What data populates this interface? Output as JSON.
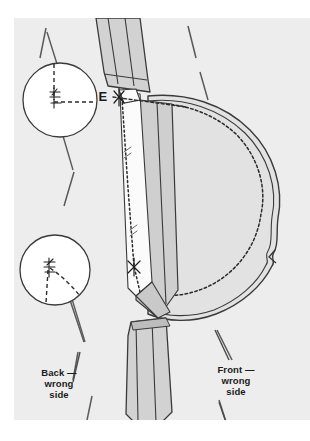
{
  "figure": {
    "type": "sewing-construction-diagram",
    "canvas": {
      "width": 310,
      "height": 441
    },
    "background_color": "#ffffff",
    "panel": {
      "color": "#ededed",
      "x": 14,
      "y": 18,
      "width": 296,
      "height": 402
    },
    "colors": {
      "panel_gray": "#ededed",
      "fabric_light": "#e2e2e2",
      "fabric_mid": "#d2d2d2",
      "fabric_dark": "#bdbdbd",
      "fabric_white": "#fbfbfb",
      "outline": "#3a3a3a",
      "stitch": "#2b2b2b",
      "text": "#1b1b1b",
      "circle_fill": "#ffffff"
    }
  },
  "labels": {
    "point_e": "E",
    "back_piece": "Back —\nwrong\nside",
    "front_piece": "Front —\nwrong\nside"
  },
  "callouts": [
    {
      "name": "upper-detail-circle",
      "cx": 60,
      "cy": 100,
      "r": 37,
      "detail": "crosshair-stitch-corner",
      "leader_top": {
        "x1": 57,
        "y1": 63,
        "x2": 46,
        "y2": 30
      },
      "leader_bottom": {
        "x1": 62,
        "y1": 137,
        "x2": 74,
        "y2": 172
      }
    },
    {
      "name": "lower-detail-circle",
      "cx": 55,
      "cy": 270,
      "r": 35,
      "detail": "angled-stitch-corner",
      "leader_bottom": {
        "x1": 70,
        "y1": 300,
        "x2": 86,
        "y2": 344
      }
    }
  ],
  "annotations": {
    "clip_marks": [
      {
        "name": "clip-mark-upper",
        "x": 122,
        "y": 98
      },
      {
        "name": "clip-mark-lower",
        "x": 137,
        "y": 267
      }
    ],
    "stitch_line": "dotted vertical seam line from E down to lower clip mark",
    "collar_stitch_line": "dashed curved stitching line around collar edge",
    "notch": {
      "name": "collar-notch",
      "x": 273,
      "y": 258
    }
  },
  "pieces": [
    {
      "name": "placket-band-upper",
      "fill": "#d2d2d2"
    },
    {
      "name": "placket-band-lower",
      "fill": "#d2d2d2"
    },
    {
      "name": "collar-piece",
      "fill": "#e2e2e2"
    },
    {
      "name": "under-collar-band",
      "fill": "#c9c9c9"
    },
    {
      "name": "seam-allowance-strip",
      "fill": "#fbfbfb"
    }
  ]
}
